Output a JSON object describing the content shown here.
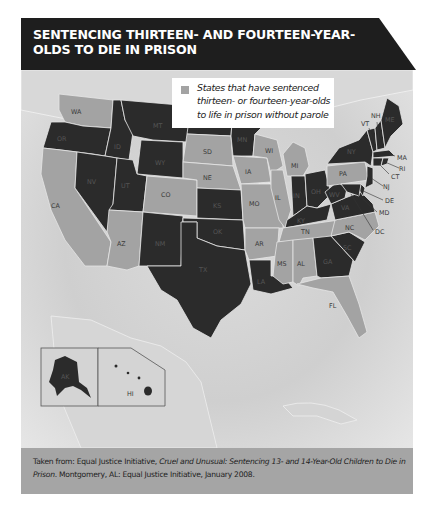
{
  "title": "SENTENCING THIRTEEN- AND FOURTEEN-YEAR-OLDS TO DIE IN PRISON",
  "legend": {
    "swatch_color": "#a3a3a3",
    "label": "States that have sentenced thirteen- or fourteen-year-olds to life in prison without parole"
  },
  "colors": {
    "banner": "#1e1e1e",
    "shaded_state": "#a3a3a3",
    "dark_state": "#2b2b2b",
    "caption_bg": "#a5a5a5"
  },
  "map": {
    "shaded_states": [
      "WA",
      "CA",
      "AZ",
      "CO",
      "SD",
      "NE",
      "IA",
      "MO",
      "AR",
      "MS",
      "AL",
      "TN",
      "IL",
      "WI",
      "MI",
      "PA",
      "NC",
      "FL",
      "DC"
    ],
    "other_states": [
      "OR",
      "ID",
      "MT",
      "WY",
      "NV",
      "UT",
      "ND",
      "MN",
      "KS",
      "NM",
      "OK",
      "TX",
      "LA",
      "IN",
      "OH",
      "KY",
      "WV",
      "VA",
      "GA",
      "SC",
      "NY",
      "VT",
      "NH",
      "ME",
      "MA",
      "RI",
      "CT",
      "NJ",
      "DE",
      "MD",
      "AK",
      "HI"
    ],
    "labels": {
      "WA": "WA",
      "OR": "OR",
      "CA": "CA",
      "ID": "ID",
      "NV": "NV",
      "MT": "MT",
      "WY": "WY",
      "UT": "UT",
      "AZ": "AZ",
      "CO": "CO",
      "NM": "NM",
      "ND": "ND",
      "SD": "SD",
      "NE": "NE",
      "KS": "KS",
      "OK": "OK",
      "TX": "TX",
      "MN": "MN",
      "IA": "IA",
      "MO": "MO",
      "AR": "AR",
      "LA": "LA",
      "WI": "WI",
      "IL": "IL",
      "MI": "MI",
      "IN": "IN",
      "OH": "OH",
      "KY": "KY",
      "TN": "TN",
      "MS": "MS",
      "AL": "AL",
      "GA": "GA",
      "FL": "FL",
      "SC": "SC",
      "NC": "NC",
      "VA": "VA",
      "WV": "WV",
      "PA": "PA",
      "NY": "NY",
      "VT": "VT",
      "NH": "NH",
      "ME": "ME",
      "MA": "MA",
      "RI": "RI",
      "CT": "CT",
      "NJ": "NJ",
      "DE": "DE",
      "MD": "MD",
      "DC": "DC",
      "AK": "AK",
      "HI": "HI"
    }
  },
  "caption": {
    "prefix": "Taken from: Equal Justice Initiative, ",
    "title_italic": "Cruel and Unusual: Sentencing 13- and 14-Year-Old Children to Die in Prison",
    "suffix": ". Montgomery, AL: Equal Justice Initiative, January 2008."
  }
}
